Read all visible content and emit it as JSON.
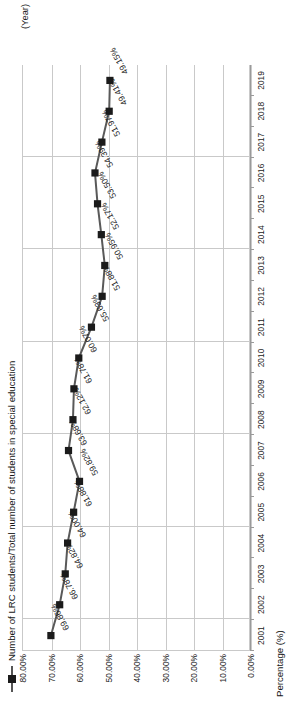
{
  "legend": {
    "label": "Number of LRC students/Total number of students in special education",
    "marker_icon": "square-marker-icon",
    "line_color": "#595959",
    "marker_color": "#1b1b1b"
  },
  "axis": {
    "y_title": "Percentage  (%)",
    "x_title": "(Year)",
    "y_ticks": [
      "80.00%",
      "70.00%",
      "60.00%",
      "50.00%",
      "40.00%",
      "30.00%",
      "20.00%",
      "10.00%",
      "0.00%"
    ],
    "x_ticks": [
      "2001",
      "2002",
      "2003",
      "2004",
      "2005",
      "2006",
      "2007",
      "2008",
      "2009",
      "2010",
      "2011",
      "2012",
      "2013",
      "2014",
      "2015",
      "2016",
      "2017",
      "2018",
      "2019"
    ]
  },
  "data_labels": [
    "69.86%",
    "66.78%",
    "64.82%",
    "64.00%",
    "61.88%",
    "59.82%",
    "63.68%",
    "62.12%",
    "61.78%",
    "60.07%",
    "55.63%",
    "51.88%",
    "50.95%",
    "52.17%",
    "53.50%",
    "54.39%",
    "51.97%",
    "49.41%",
    "49.15%"
  ],
  "chart_data": {
    "type": "line",
    "title": "",
    "subtitle": "",
    "xlabel": "(Year)",
    "ylabel": "Percentage  (%)",
    "ylim": [
      0,
      80
    ],
    "ytick_values": [
      80,
      70,
      60,
      50,
      40,
      30,
      20,
      10,
      0
    ],
    "grid": true,
    "legend_position": "top-left",
    "x": [
      "2001",
      "2002",
      "2003",
      "2004",
      "2005",
      "2006",
      "2007",
      "2008",
      "2009",
      "2010",
      "2011",
      "2012",
      "2013",
      "2014",
      "2015",
      "2016",
      "2017",
      "2018",
      "2019"
    ],
    "series": [
      {
        "name": "Number of LRC students/Total number of students in special education",
        "values": [
          69.86,
          66.78,
          64.82,
          64.0,
          61.88,
          59.82,
          63.68,
          62.12,
          61.78,
          60.07,
          55.63,
          51.88,
          50.95,
          52.17,
          53.5,
          54.39,
          51.97,
          49.41,
          49.15
        ],
        "marker": "square",
        "color": "#595959"
      }
    ]
  }
}
